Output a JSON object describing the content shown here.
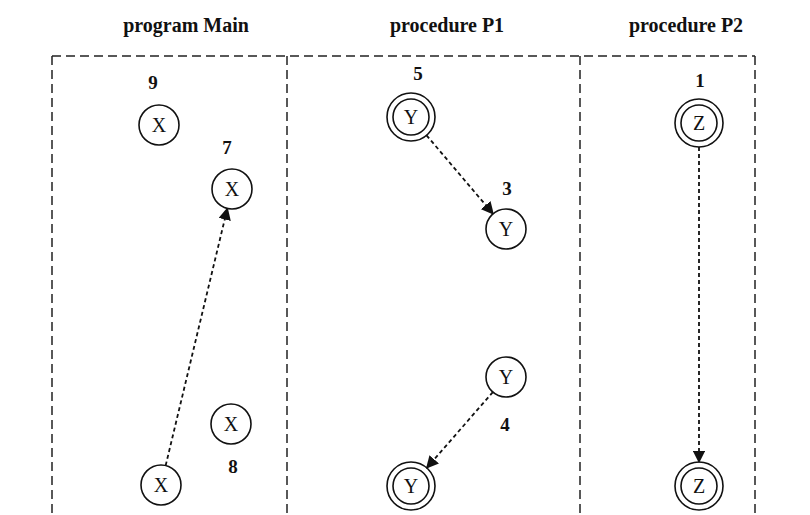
{
  "sections": [
    {
      "title": "program Main",
      "center_x": 186
    },
    {
      "title": "procedure P1",
      "center_x": 447
    },
    {
      "title": "procedure P2",
      "center_x": 686
    }
  ],
  "frame": {
    "left": 52,
    "top": 56,
    "right": 755,
    "bottom": 515,
    "dividers": [
      287,
      580
    ]
  },
  "nodes": [
    {
      "id": "main-x-9",
      "symbol": "X",
      "label": "9",
      "double": false,
      "cx": 159,
      "cy": 125,
      "lx": 153,
      "ly": 89
    },
    {
      "id": "main-x-7",
      "symbol": "X",
      "label": "7",
      "double": false,
      "cx": 232,
      "cy": 189,
      "lx": 227,
      "ly": 154
    },
    {
      "id": "main-x-8",
      "symbol": "X",
      "label": "8",
      "double": false,
      "cx": 231,
      "cy": 424,
      "lx": 233,
      "ly": 473
    },
    {
      "id": "main-x-bottom",
      "symbol": "X",
      "label": "",
      "double": false,
      "cx": 161,
      "cy": 485,
      "lx": 0,
      "ly": 0
    },
    {
      "id": "p1-y-5",
      "symbol": "Y",
      "label": "5",
      "double": true,
      "cx": 411,
      "cy": 117,
      "lx": 418,
      "ly": 80
    },
    {
      "id": "p1-y-3",
      "symbol": "Y",
      "label": "3",
      "double": false,
      "cx": 506,
      "cy": 229,
      "lx": 507,
      "ly": 195
    },
    {
      "id": "p1-y-4",
      "symbol": "Y",
      "label": "4",
      "double": false,
      "cx": 506,
      "cy": 377,
      "lx": 505,
      "ly": 431
    },
    {
      "id": "p1-y-bottom",
      "symbol": "Y",
      "label": "",
      "double": true,
      "cx": 411,
      "cy": 486,
      "lx": 0,
      "ly": 0
    },
    {
      "id": "p2-z-1",
      "symbol": "Z",
      "label": "1",
      "double": true,
      "cx": 699,
      "cy": 123,
      "lx": 700,
      "ly": 87
    },
    {
      "id": "p2-z-bottom",
      "symbol": "Z",
      "label": "",
      "double": true,
      "cx": 699,
      "cy": 486,
      "lx": 0,
      "ly": 0
    }
  ],
  "edges": [
    {
      "from": "main-x-bottom",
      "to": "main-x-7",
      "style": "dashed"
    },
    {
      "from": "p1-y-5",
      "to": "p1-y-3",
      "style": "dashed"
    },
    {
      "from": "p1-y-4",
      "to": "p1-y-bottom",
      "style": "dashed"
    },
    {
      "from": "p2-z-1",
      "to": "p2-z-bottom",
      "style": "dashed"
    }
  ]
}
